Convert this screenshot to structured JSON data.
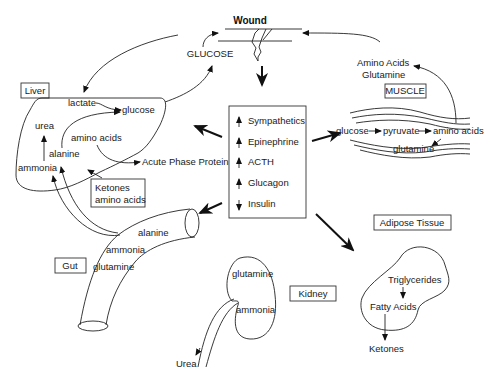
{
  "diagram": {
    "title": "Wound",
    "center_label": "GLUCOSE",
    "hormone_box": {
      "items": [
        {
          "direction": "up",
          "label": "Sympathetics"
        },
        {
          "direction": "up",
          "label": "Epinephrine"
        },
        {
          "direction": "up",
          "label": "ACTH"
        },
        {
          "direction": "up",
          "label": "Glucagon"
        },
        {
          "direction": "down",
          "label": "Insulin"
        }
      ]
    },
    "liver": {
      "label": "Liver",
      "contents": [
        "lactate",
        "glucose",
        "urea",
        "amino acids",
        "alanine",
        "ammonia"
      ],
      "output": "Acute Phase Protein",
      "input_box": [
        "Ketones",
        "amino acids"
      ]
    },
    "muscle": {
      "label": "MUSCLE",
      "output_top": [
        "Amino Acids",
        "Glutamine"
      ],
      "pathway": [
        "glucose",
        "pyruvate",
        "amino acids"
      ],
      "bottom": "glutamine"
    },
    "gut": {
      "label": "Gut",
      "contents": [
        "alanine",
        "ammonia",
        "glutamine"
      ]
    },
    "kidney": {
      "label": "Kidney",
      "contents": [
        "glutamine",
        "ammonia"
      ],
      "output": "Urea"
    },
    "adipose": {
      "label": "Adipose Tissue",
      "contents": [
        "Triglycerides",
        "Fatty Acids"
      ],
      "output": "Ketones"
    }
  }
}
